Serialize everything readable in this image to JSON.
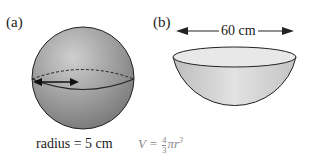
{
  "panel_a": {
    "label": "(a)",
    "caption": "radius = 5 cm",
    "shape": "sphere"
  },
  "panel_b": {
    "label": "(b)",
    "dimension": "60 cm",
    "shape": "hemisphere-bowl"
  },
  "formula": {
    "lhs": "V =",
    "numerator": "4",
    "denominator": "3",
    "rest": "πr",
    "exponent": "3"
  },
  "colors": {
    "sphere_light": "#c8c8c8",
    "sphere_dark": "#7a7a7a",
    "bowl_fill": "#d6d6d6",
    "outline": "#222222"
  }
}
